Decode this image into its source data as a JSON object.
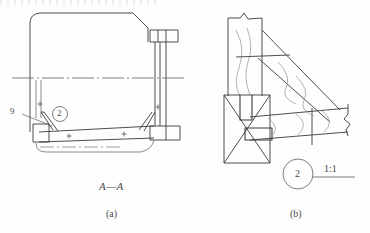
{
  "figure": {
    "title_section": "A—A",
    "caption_a": "(a)",
    "caption_b": "(b)",
    "part_number_leader": "9",
    "detail_callout_a": "2",
    "detail_callout_b": "2",
    "detail_scale": "1:1"
  },
  "colors": {
    "line": "#3a3a3a",
    "line_light": "#6e6e6e",
    "break_line": "#9aa0a6",
    "text": "#4a4a4a",
    "paper": "#fefefe"
  },
  "weld_marks": {
    "symbol": "+",
    "count": 6
  }
}
